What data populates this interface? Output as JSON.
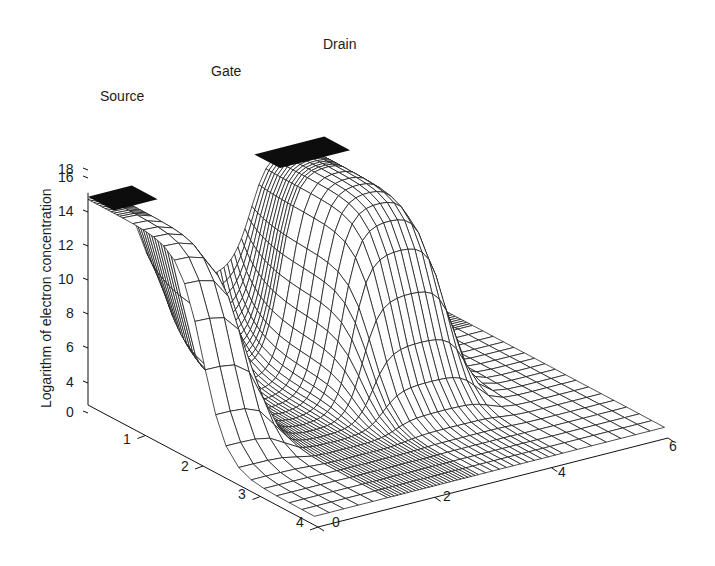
{
  "chart_data": {
    "type": "surface3d",
    "title": "",
    "zlabel": "Logarithm of electron concentration",
    "xlabel": "",
    "ylabel": "",
    "annotations": [
      {
        "text": "Source",
        "x": 100,
        "y": 88
      },
      {
        "text": "Gate",
        "x": 211,
        "y": 63
      },
      {
        "text": "Drain",
        "x": 323,
        "y": 36
      }
    ],
    "z_ticks": [
      {
        "label": "18",
        "value": 18,
        "y": 170
      },
      {
        "label": "16",
        "value": 16,
        "y": 178
      },
      {
        "label": "14",
        "value": 14,
        "y": 212
      },
      {
        "label": "12",
        "value": 12,
        "y": 246
      },
      {
        "label": "10",
        "value": 10,
        "y": 280
      },
      {
        "label": "8",
        "value": 8,
        "y": 314
      },
      {
        "label": "6",
        "value": 6,
        "y": 348
      },
      {
        "label": "4",
        "value": 4,
        "y": 383
      },
      {
        "label": "0",
        "value": 0,
        "y": 413
      }
    ],
    "depth_axis_ticks": [
      {
        "label": "1",
        "x": 128,
        "y": 440
      },
      {
        "label": "2",
        "x": 186,
        "y": 467
      },
      {
        "label": "3",
        "x": 243,
        "y": 495
      },
      {
        "label": "4",
        "x": 301,
        "y": 523
      }
    ],
    "length_axis_ticks": [
      {
        "label": "0",
        "x": 337,
        "y": 523
      },
      {
        "label": "2",
        "x": 448,
        "y": 497
      },
      {
        "label": "4",
        "x": 563,
        "y": 473
      },
      {
        "label": "6",
        "x": 674,
        "y": 447
      }
    ],
    "z_range": [
      0,
      19
    ],
    "length_range": [
      0,
      6
    ],
    "depth_range": [
      0,
      4
    ],
    "regions": [
      {
        "name": "Source",
        "length_start": 0,
        "length_end": 1.0,
        "log_n": 18.5
      },
      {
        "name": "Gate",
        "length_start": 1.0,
        "length_end": 2.6,
        "log_n_min": 3.0,
        "log_n_channel_surface": 9.5
      },
      {
        "name": "Drain",
        "length_start": 2.6,
        "length_end": 4.2,
        "log_n": 18.5
      },
      {
        "name": "Substrate",
        "log_n": 3.0
      }
    ],
    "grid": false,
    "style": "black wireframe mesh on white"
  }
}
